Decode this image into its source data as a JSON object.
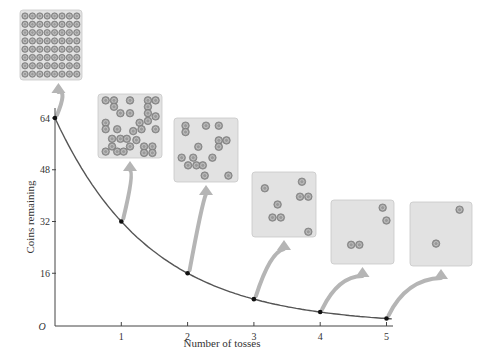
{
  "chart_data": {
    "type": "line",
    "title": "",
    "xlabel": "Number of tosses",
    "ylabel": "Coins remaining",
    "x": [
      0,
      1,
      2,
      3,
      4,
      5
    ],
    "series": [
      {
        "name": "Coins remaining",
        "values": [
          64,
          32,
          16,
          8,
          4,
          2
        ]
      }
    ],
    "x_ticks": [
      "1",
      "2",
      "3",
      "4",
      "5"
    ],
    "y_ticks": [
      "16",
      "32",
      "48",
      "64"
    ],
    "origin_label": "O",
    "xlim": [
      0,
      5.1
    ],
    "ylim": [
      0,
      66
    ],
    "grid": false,
    "legend": "none",
    "annotations": [
      {
        "at_toss": 0,
        "coins_shown": 64,
        "description": "square tray of 64 coins arranged in 8x8 grid"
      },
      {
        "at_toss": 1,
        "coins_shown": 32,
        "description": "tray with scattered remaining coins"
      },
      {
        "at_toss": 2,
        "coins_shown": 16,
        "description": "tray with scattered remaining coins"
      },
      {
        "at_toss": 3,
        "coins_shown": 8,
        "description": "tray with scattered remaining coins"
      },
      {
        "at_toss": 4,
        "coins_shown": 4,
        "description": "tray with scattered remaining coins"
      },
      {
        "at_toss": 5,
        "coins_shown": 2,
        "description": "tray with scattered remaining coins"
      }
    ]
  },
  "colors": {
    "curve": "#555555",
    "axis": "#444444",
    "tray_fill": "#e2e2e2",
    "tray_stroke": "#c8c8c8",
    "coin_fill": "#9a9a9a",
    "coin_stroke": "#6e6e6e",
    "arrow": "#b5b5b5",
    "point": "#111111"
  }
}
